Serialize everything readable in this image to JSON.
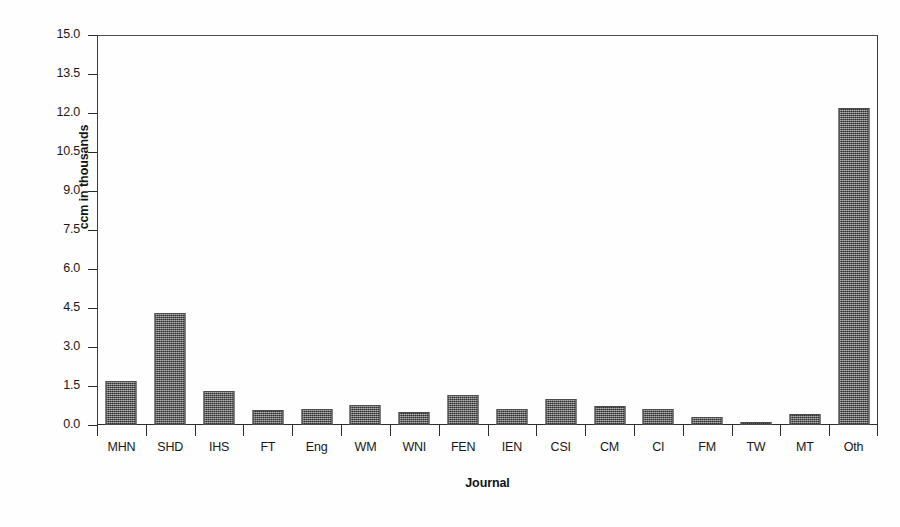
{
  "chart_data": {
    "type": "bar",
    "title": "",
    "xlabel": "Journal",
    "ylabel": "ccm in thousands",
    "categories": [
      "MHN",
      "SHD",
      "IHS",
      "FT",
      "Eng",
      "WM",
      "WNI",
      "FEN",
      "IEN",
      "CSI",
      "CM",
      "CI",
      "FM",
      "TW",
      "MT",
      "Oth"
    ],
    "values": [
      1.7,
      4.3,
      1.3,
      0.57,
      0.63,
      0.77,
      0.5,
      1.15,
      0.6,
      1.0,
      0.75,
      0.6,
      0.3,
      0.1,
      0.42,
      12.2
    ],
    "ylim": [
      0.0,
      15.0
    ],
    "ytick_labels": [
      "15.0",
      "13.5",
      "12.0",
      "10.5",
      "9.0",
      "7.5",
      "6.0",
      "4.5",
      "3.0",
      "1.5",
      "0.0"
    ],
    "ytick_values": [
      15.0,
      13.5,
      12.0,
      10.5,
      9.0,
      7.5,
      6.0,
      4.5,
      3.0,
      1.5,
      0.0
    ],
    "grid": false,
    "legend": "none",
    "bar_color": "#6e6e6e",
    "axis_color": "#2e2e2e",
    "background": "#ffffff"
  }
}
